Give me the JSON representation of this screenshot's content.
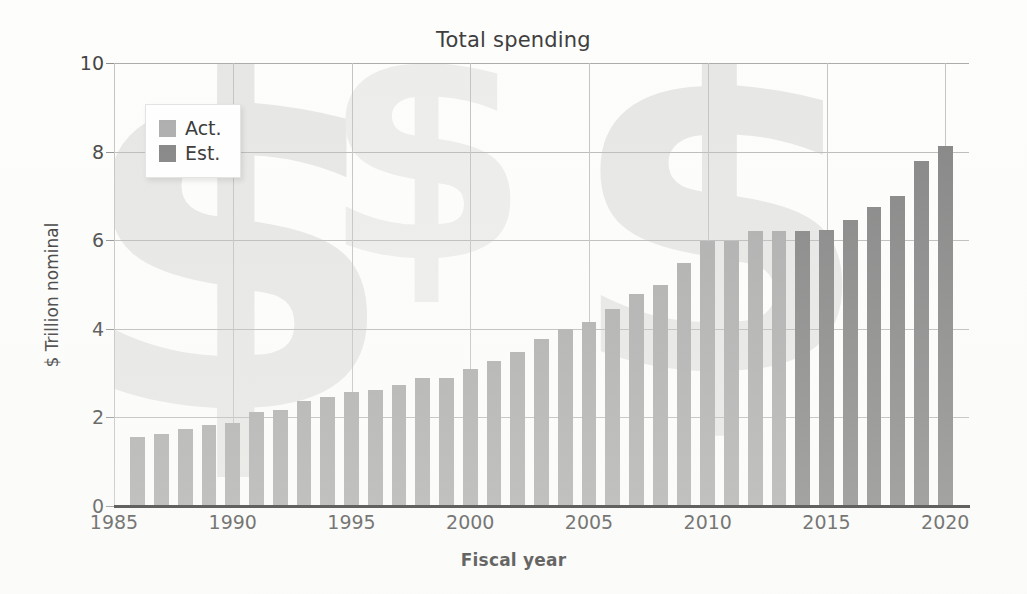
{
  "chart_data": {
    "type": "bar",
    "title": "Total spending",
    "xlabel": "Fiscal year",
    "ylabel": "$ Trillion nominal",
    "ylim": [
      0,
      10
    ],
    "xlim": [
      1985,
      2021
    ],
    "ytick_labels": [
      "0",
      "2",
      "4",
      "6",
      "8",
      "10"
    ],
    "ytick_values": [
      0,
      2,
      4,
      6,
      8,
      10
    ],
    "xtick_labels": [
      "1985",
      "1990",
      "1995",
      "2000",
      "2005",
      "2010",
      "2015",
      "2020"
    ],
    "xtick_values": [
      1985,
      1990,
      1995,
      2000,
      2005,
      2010,
      2015,
      2020
    ],
    "grid": true,
    "legend_position": "upper-left",
    "legend": [
      {
        "key": "act",
        "label": "Act.",
        "color": "#aaaaaa"
      },
      {
        "key": "est",
        "label": "Est.",
        "color": "#808080"
      }
    ],
    "categories": [
      1986,
      1987,
      1988,
      1989,
      1990,
      1991,
      1992,
      1993,
      1994,
      1995,
      1996,
      1997,
      1998,
      1999,
      2000,
      2001,
      2002,
      2003,
      2004,
      2005,
      2006,
      2007,
      2008,
      2009,
      2010,
      2011,
      2012,
      2013,
      2014,
      2015,
      2016,
      2017,
      2018,
      2019,
      2020
    ],
    "values": [
      1.55,
      1.63,
      1.73,
      1.82,
      1.87,
      2.12,
      2.17,
      2.37,
      2.45,
      2.58,
      2.63,
      2.73,
      2.88,
      2.9,
      3.1,
      3.27,
      3.48,
      3.78,
      4.0,
      4.15,
      4.45,
      4.78,
      4.98,
      5.48,
      5.98,
      5.98,
      6.2,
      6.2,
      6.2,
      6.22,
      6.45,
      6.75,
      7.0,
      7.78,
      8.13
    ],
    "series_key": [
      "act",
      "act",
      "act",
      "act",
      "act",
      "act",
      "act",
      "act",
      "act",
      "act",
      "act",
      "act",
      "act",
      "act",
      "act",
      "act",
      "act",
      "act",
      "act",
      "act",
      "act",
      "act",
      "act",
      "act",
      "act",
      "act",
      "act",
      "act",
      "est",
      "est",
      "est",
      "est",
      "est",
      "est",
      "est"
    ],
    "annotations": [
      {
        "name": "dollar-watermark",
        "text": "$"
      },
      {
        "name": "dollar-watermark",
        "text": "$"
      },
      {
        "name": "dollar-watermark",
        "text": "$"
      }
    ]
  },
  "watermark": {
    "glyph": "$"
  }
}
